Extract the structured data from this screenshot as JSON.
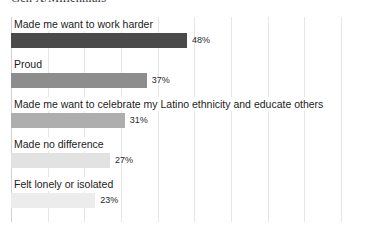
{
  "chart_data": {
    "type": "bar",
    "orientation": "horizontal",
    "title": "Gen X/Millennials",
    "xlabel": "",
    "ylabel": "",
    "grid": true,
    "legend": false,
    "xlim": [
      0,
      96
    ],
    "gridline_step_percent": 10,
    "categories": [
      "Made me want to work harder",
      "Proud",
      "Made me want to celebrate my Latino ethnicity and educate others",
      "Made no difference",
      "Felt lonely or isolated"
    ],
    "values": [
      48,
      37,
      31,
      27,
      23
    ],
    "value_labels": [
      "48%",
      "37%",
      "31%",
      "27%",
      "23%"
    ],
    "bar_colors": [
      "#4a4a4a",
      "#8d8d8d",
      "#aeaeae",
      "#e2e2e2",
      "#ececec"
    ]
  },
  "chart": {
    "title": "Gen X/Millennials",
    "bars": [
      {
        "label": "Made me want to work harder",
        "value_label": "48%",
        "value": 48,
        "color": "#4a4a4a"
      },
      {
        "label": "Proud",
        "value_label": "37%",
        "value": 37,
        "color": "#8d8d8d"
      },
      {
        "label": "Made me want to celebrate my Latino ethnicity and educate others",
        "value_label": "31%",
        "value": 31,
        "color": "#aeaeae"
      },
      {
        "label": "Made no difference",
        "value_label": "27%",
        "value": 27,
        "color": "#e2e2e2"
      },
      {
        "label": "Felt lonely or isolated",
        "value_label": "23%",
        "value": 23,
        "color": "#ececec"
      }
    ]
  }
}
